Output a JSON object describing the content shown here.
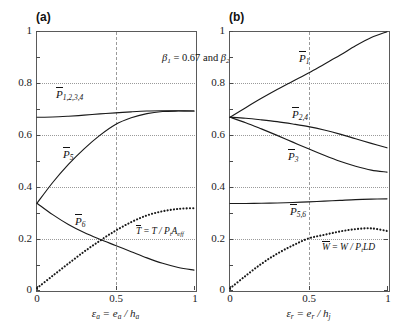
{
  "figure": {
    "title": "β1 = 0.67 and β2 = 0.33",
    "title_beta1": "β",
    "title_beta1_sub": "1",
    "title_eq1": " = 0.67 and ",
    "title_beta2": "β",
    "title_beta2_sub": "2",
    "title_eq2": " = 0.33"
  },
  "panels": [
    {
      "tag": "(a)",
      "xlabel_main": "ε",
      "xlabel_sub": "a",
      "xlabel_rest": " = e",
      "xlabel_sub2": "a",
      "xlabel_rest2": " / h",
      "xlabel_sub3": "a",
      "yticks": [
        "0",
        "0.2",
        "0.4",
        "0.6",
        "0.8",
        "1"
      ],
      "xticks": [
        "0",
        "0.5",
        "1"
      ],
      "labels": [
        {
          "name": "P-bar-1234",
          "text": "P",
          "sub": "1,2,3,4"
        },
        {
          "name": "P-bar-5",
          "text": "P",
          "sub": "5"
        },
        {
          "name": "P-bar-6",
          "text": "P",
          "sub": "6"
        },
        {
          "name": "T-bar-formula",
          "text": "T = T / P",
          "sub": "t",
          "text2": "A",
          "sub2": "eff"
        }
      ]
    },
    {
      "tag": "(b)",
      "xlabel_main": "ε",
      "xlabel_sub": "r",
      "xlabel_rest": " = e",
      "xlabel_sub2": "r",
      "xlabel_rest2": " / h",
      "xlabel_sub3": "j",
      "yticks": [
        "0",
        "0.2",
        "0.4",
        "0.6",
        "0.8",
        "1"
      ],
      "xticks": [
        "0",
        "0.5",
        "1"
      ],
      "labels": [
        {
          "name": "P-bar-1",
          "text": "P",
          "sub": "1"
        },
        {
          "name": "P-bar-24",
          "text": "P",
          "sub": "2,4"
        },
        {
          "name": "P-bar-3",
          "text": "P",
          "sub": "3"
        },
        {
          "name": "P-bar-56",
          "text": "P",
          "sub": "5,6"
        },
        {
          "name": "W-bar-formula",
          "text": "W = W / P",
          "sub": "t",
          "text2": "LD"
        }
      ]
    }
  ],
  "chart_data": [
    {
      "type": "line",
      "panel": "(a)",
      "title": "β1 = 0.67 and β2 = 0.33",
      "xlabel": "ε_a = e_a / h_a",
      "ylabel": "",
      "xlim": [
        0,
        1
      ],
      "ylim": [
        0,
        1
      ],
      "xticks": [
        0,
        0.5,
        1
      ],
      "yticks": [
        0,
        0.2,
        0.4,
        0.6,
        0.8,
        1
      ],
      "grid": true,
      "legend": "inline-curve-labels",
      "series": [
        {
          "name": "P_1,2,3,4",
          "style": "solid",
          "x": [
            0,
            0.1,
            0.2,
            0.3,
            0.4,
            0.5,
            0.6,
            0.7,
            0.8,
            0.9,
            1.0
          ],
          "values": [
            0.667,
            0.668,
            0.671,
            0.675,
            0.68,
            0.684,
            0.688,
            0.691,
            0.692,
            0.692,
            0.691
          ]
        },
        {
          "name": "P_5",
          "style": "solid",
          "x": [
            0,
            0.1,
            0.2,
            0.3,
            0.4,
            0.5,
            0.6,
            0.7,
            0.8,
            0.9,
            1.0
          ],
          "values": [
            0.335,
            0.415,
            0.485,
            0.545,
            0.597,
            0.639,
            0.665,
            0.681,
            0.689,
            0.691,
            0.691
          ]
        },
        {
          "name": "P_6",
          "style": "solid",
          "x": [
            0,
            0.1,
            0.2,
            0.3,
            0.4,
            0.5,
            0.6,
            0.7,
            0.8,
            0.9,
            1.0
          ],
          "values": [
            0.335,
            0.291,
            0.253,
            0.222,
            0.196,
            0.172,
            0.148,
            0.124,
            0.103,
            0.087,
            0.077
          ]
        },
        {
          "name": "T = T / P_t A_eff",
          "style": "dotted",
          "x": [
            0,
            0.1,
            0.2,
            0.3,
            0.4,
            0.5,
            0.6,
            0.7,
            0.8,
            0.9,
            1.0
          ],
          "values": [
            0.007,
            0.055,
            0.102,
            0.148,
            0.19,
            0.229,
            0.262,
            0.288,
            0.304,
            0.313,
            0.316
          ]
        }
      ]
    },
    {
      "type": "line",
      "panel": "(b)",
      "title": "β1 = 0.67 and β2 = 0.33",
      "xlabel": "ε_r = e_r / h_j",
      "ylabel": "",
      "xlim": [
        0,
        1
      ],
      "ylim": [
        0,
        1
      ],
      "xticks": [
        0,
        0.5,
        1
      ],
      "yticks": [
        0,
        0.2,
        0.4,
        0.6,
        0.8,
        1
      ],
      "grid": true,
      "legend": "inline-curve-labels",
      "series": [
        {
          "name": "P_1",
          "style": "solid",
          "x": [
            0,
            0.1,
            0.2,
            0.3,
            0.4,
            0.5,
            0.6,
            0.7,
            0.8,
            0.9,
            1.0
          ],
          "values": [
            0.667,
            0.704,
            0.74,
            0.774,
            0.806,
            0.838,
            0.872,
            0.906,
            0.943,
            0.975,
            0.997
          ]
        },
        {
          "name": "P_2,4",
          "style": "solid",
          "x": [
            0,
            0.1,
            0.2,
            0.3,
            0.4,
            0.5,
            0.6,
            0.7,
            0.8,
            0.9,
            1.0
          ],
          "values": [
            0.667,
            0.663,
            0.657,
            0.65,
            0.641,
            0.631,
            0.618,
            0.602,
            0.584,
            0.566,
            0.549
          ]
        },
        {
          "name": "P_3",
          "style": "solid",
          "x": [
            0,
            0.1,
            0.2,
            0.3,
            0.4,
            0.5,
            0.6,
            0.7,
            0.8,
            0.9,
            1.0
          ],
          "values": [
            0.667,
            0.646,
            0.622,
            0.597,
            0.571,
            0.545,
            0.52,
            0.497,
            0.478,
            0.463,
            0.455
          ]
        },
        {
          "name": "P_5,6",
          "style": "solid",
          "x": [
            0,
            0.1,
            0.2,
            0.3,
            0.4,
            0.5,
            0.6,
            0.7,
            0.8,
            0.9,
            1.0
          ],
          "values": [
            0.334,
            0.334,
            0.335,
            0.336,
            0.338,
            0.34,
            0.343,
            0.346,
            0.349,
            0.351,
            0.352
          ]
        },
        {
          "name": "W = W / P_t LD",
          "style": "dotted",
          "x": [
            0,
            0.1,
            0.2,
            0.3,
            0.4,
            0.5,
            0.6,
            0.7,
            0.8,
            0.9,
            1.0
          ],
          "values": [
            0.006,
            0.055,
            0.101,
            0.14,
            0.172,
            0.199,
            0.213,
            0.226,
            0.235,
            0.238,
            0.228
          ]
        }
      ]
    }
  ]
}
